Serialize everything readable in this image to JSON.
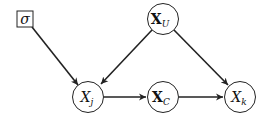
{
  "diagram": {
    "nodes": [
      {
        "id": "sigma",
        "shape": "square",
        "label": "σ",
        "sub": "",
        "cx": 25,
        "cy": 19
      },
      {
        "id": "X_U",
        "shape": "circle",
        "label": "X",
        "sub": "U",
        "bold": true,
        "cx": 163,
        "cy": 19
      },
      {
        "id": "X_j",
        "shape": "circle",
        "label": "X",
        "sub": "j",
        "bold": false,
        "cx": 88,
        "cy": 97
      },
      {
        "id": "X_C",
        "shape": "circle",
        "label": "X",
        "sub": "C",
        "bold": true,
        "cx": 163,
        "cy": 97
      },
      {
        "id": "X_k",
        "shape": "circle",
        "label": "X",
        "sub": "k",
        "bold": false,
        "cx": 240,
        "cy": 97
      }
    ],
    "edges": [
      {
        "from": "sigma",
        "to": "X_j"
      },
      {
        "from": "X_U",
        "to": "X_j"
      },
      {
        "from": "X_U",
        "to": "X_k"
      },
      {
        "from": "X_j",
        "to": "X_C"
      },
      {
        "from": "X_C",
        "to": "X_k"
      }
    ],
    "colors": {
      "stroke": "#222222",
      "background": "#ffffff"
    }
  }
}
